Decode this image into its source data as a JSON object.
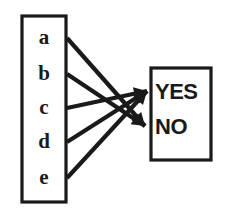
{
  "diagram": {
    "type": "mapping-diagram",
    "domain_box": {
      "name": "domain-set",
      "x": 22,
      "y": 16,
      "width": 44,
      "height": 186,
      "items": [
        {
          "label": "a",
          "cx": 44,
          "cy": 39
        },
        {
          "label": "b",
          "cx": 44,
          "cy": 75
        },
        {
          "label": "c",
          "cx": 44,
          "cy": 109
        },
        {
          "label": "d",
          "cx": 44,
          "cy": 143
        },
        {
          "label": "e",
          "cx": 44,
          "cy": 179
        }
      ]
    },
    "codomain_box": {
      "name": "codomain-set",
      "x": 151,
      "y": 68,
      "width": 60,
      "height": 92,
      "items": [
        {
          "label": "YES",
          "x": 155,
          "y": 93
        },
        {
          "label": "NO",
          "x": 155,
          "y": 128
        }
      ]
    },
    "targets": {
      "yes": {
        "x": 147,
        "y": 91
      },
      "no": {
        "x": 145,
        "y": 126
      }
    },
    "edges": [
      {
        "from": "a",
        "to": "NO",
        "x1": 67,
        "y1": 38,
        "x2": 145,
        "y2": 126
      },
      {
        "from": "b",
        "to": "NO",
        "x1": 67,
        "y1": 74,
        "x2": 145,
        "y2": 126
      },
      {
        "from": "c",
        "to": "YES",
        "x1": 67,
        "y1": 108,
        "x2": 147,
        "y2": 91
      },
      {
        "from": "d",
        "to": "YES",
        "x1": 67,
        "y1": 142,
        "x2": 147,
        "y2": 91
      },
      {
        "from": "e",
        "to": "YES",
        "x1": 67,
        "y1": 178,
        "x2": 147,
        "y2": 91
      }
    ],
    "colors": {
      "ink": "#1a1a1a",
      "paper": "#ffffff"
    }
  }
}
